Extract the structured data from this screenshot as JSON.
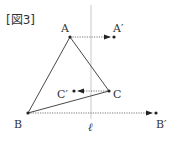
{
  "figure": {
    "title": "[図3]",
    "line_label": "ℓ",
    "points": {
      "A": {
        "label": "A",
        "x": 70,
        "y": 37
      },
      "B": {
        "label": "B",
        "x": 28,
        "y": 113
      },
      "C": {
        "label": "C",
        "x": 109,
        "y": 91
      },
      "A_prime": {
        "label": "A′",
        "x": 114,
        "y": 37
      },
      "B_prime": {
        "label": "B′",
        "x": 156,
        "y": 113
      },
      "C_prime": {
        "label": "C′",
        "x": 74,
        "y": 91
      }
    },
    "colors": {
      "ink": "#333333",
      "line_l": "#bbbbbb",
      "dotted": "#555555"
    }
  }
}
